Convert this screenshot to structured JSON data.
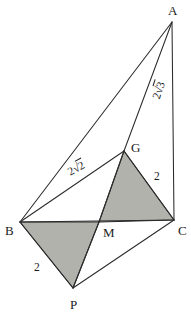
{
  "figure": {
    "background_color": "#ffffff",
    "stroke_color": "#2b2b2b",
    "shaded_fill_color": "#b2b2ad"
  },
  "vertices": [
    {
      "id": "A",
      "label": "A",
      "x": 172,
      "y": 22,
      "label_x": 168,
      "label_y": 4
    },
    {
      "id": "B",
      "label": "B",
      "x": 20,
      "y": 222,
      "label_x": 5,
      "label_y": 224
    },
    {
      "id": "C",
      "label": "C",
      "x": 174,
      "y": 220,
      "label_x": 178,
      "label_y": 224
    },
    {
      "id": "G",
      "label": "G",
      "x": 124,
      "y": 151,
      "label_x": 131,
      "label_y": 141
    },
    {
      "id": "M",
      "label": "M",
      "x": 99,
      "y": 222,
      "label_x": 103,
      "label_y": 226
    },
    {
      "id": "P",
      "label": "P",
      "x": 73,
      "y": 288,
      "label_x": 70,
      "label_y": 298
    }
  ],
  "edges": [
    {
      "name": "edge-A-B",
      "from": "A",
      "to": "B"
    },
    {
      "name": "edge-A-G",
      "from": "A",
      "to": "G"
    },
    {
      "name": "edge-A-C",
      "from": "A",
      "to": "C"
    },
    {
      "name": "edge-B-G",
      "from": "B",
      "to": "G"
    },
    {
      "name": "edge-B-C",
      "from": "B",
      "to": "C"
    },
    {
      "name": "edge-G-C",
      "from": "G",
      "to": "C"
    },
    {
      "name": "edge-G-M",
      "from": "G",
      "to": "M"
    },
    {
      "name": "edge-B-P",
      "from": "B",
      "to": "P"
    },
    {
      "name": "edge-M-P",
      "from": "M",
      "to": "P"
    },
    {
      "name": "edge-P-C",
      "from": "P",
      "to": "C"
    }
  ],
  "shaded_faces": [
    {
      "name": "shaded-triangle-GMC",
      "points": "124,151 99,222 174,220"
    },
    {
      "name": "shaded-triangle-BMP",
      "points": "20,222 99,222 73,288"
    }
  ],
  "length_labels": [
    {
      "id": "len-AG",
      "segment": "AG",
      "text": "2√3",
      "coefficient": "2",
      "radicand": "3",
      "x": 151,
      "y": 97,
      "rotation": -72
    },
    {
      "id": "len-BG",
      "segment": "BG",
      "text": "2√2",
      "coefficient": "2",
      "radicand": "2",
      "x": 66,
      "y": 168,
      "rotation": -29
    },
    {
      "id": "len-GC",
      "segment": "GC",
      "text": "2",
      "coefficient": "2",
      "radicand": "",
      "x": 154,
      "y": 171,
      "rotation": 0
    },
    {
      "id": "len-BP",
      "segment": "BP",
      "text": "2",
      "coefficient": "2",
      "radicand": "",
      "x": 34,
      "y": 262,
      "rotation": 0
    }
  ]
}
